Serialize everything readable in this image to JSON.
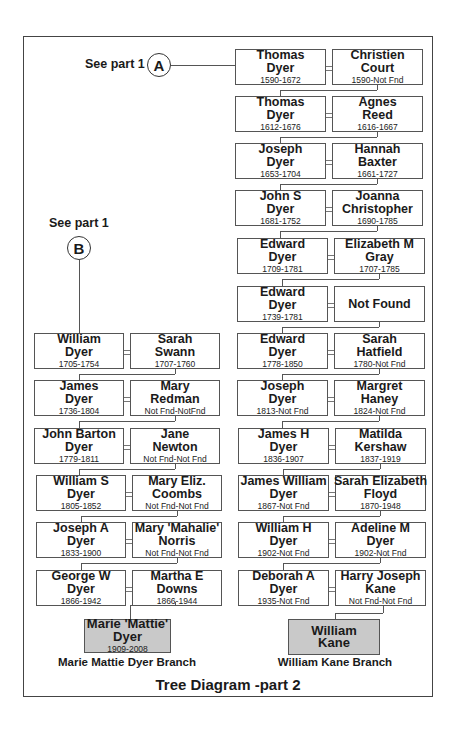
{
  "title": "Tree Diagram -part 2",
  "connectors": {
    "a": {
      "see_text": "See part 1",
      "letter": "A"
    },
    "b": {
      "see_text": "See part 1",
      "letter": "B"
    }
  },
  "right_column": [
    {
      "husband": {
        "name1": "Thomas",
        "name2": "Dyer",
        "dates": "1590-1672"
      },
      "wife": {
        "name1": "Christien",
        "name2": "Court",
        "dates": "1590-Not Fnd"
      }
    },
    {
      "husband": {
        "name1": "Thomas",
        "name2": "Dyer",
        "dates": "1612-1676"
      },
      "wife": {
        "name1": "Agnes",
        "name2": "Reed",
        "dates": "1616-1667"
      }
    },
    {
      "husband": {
        "name1": "Joseph",
        "name2": "Dyer",
        "dates": "1653-1704"
      },
      "wife": {
        "name1": "Hannah",
        "name2": "Baxter",
        "dates": "1661-1727"
      }
    },
    {
      "husband": {
        "name1": "John S",
        "name2": "Dyer",
        "dates": "1681-1752"
      },
      "wife": {
        "name1": "Joanna",
        "name2": "Christopher",
        "dates": "1690-1785"
      }
    },
    {
      "husband": {
        "name1": "Edward",
        "name2": "Dyer",
        "dates": "1709-1781"
      },
      "wife": {
        "name1": "Elizabeth M",
        "name2": "Gray",
        "dates": "1707-1785"
      }
    },
    {
      "husband": {
        "name1": "Edward",
        "name2": "Dyer",
        "dates": "1739-1781"
      },
      "wife": {
        "name1": "Not Found",
        "name2": "",
        "dates": ""
      }
    },
    {
      "husband": {
        "name1": "Edward",
        "name2": "Dyer",
        "dates": "1778-1850"
      },
      "wife": {
        "name1": "Sarah",
        "name2": "Hatfield",
        "dates": "1780-Not Fnd"
      }
    },
    {
      "husband": {
        "name1": "Joseph",
        "name2": "Dyer",
        "dates": "1813-Not Fnd"
      },
      "wife": {
        "name1": "Margret",
        "name2": "Haney",
        "dates": "1824-Not Fnd"
      }
    },
    {
      "husband": {
        "name1": "James H",
        "name2": "Dyer",
        "dates": "1836-1907"
      },
      "wife": {
        "name1": "Matilda",
        "name2": "Kershaw",
        "dates": "1837-1919"
      }
    },
    {
      "husband": {
        "name1": "James William",
        "name2": "Dyer",
        "dates": "1867-Not Fnd"
      },
      "wife": {
        "name1": "Sarah Elizabeth",
        "name2": "Floyd",
        "dates": "1870-1948"
      }
    },
    {
      "husband": {
        "name1": "William H",
        "name2": "Dyer",
        "dates": "1902-Not Fnd"
      },
      "wife": {
        "name1": "Adeline M",
        "name2": "Dyer",
        "dates": "1902-Not Fnd"
      }
    },
    {
      "husband": {
        "name1": "Deborah A",
        "name2": "Dyer",
        "dates": "1935-Not Fnd"
      },
      "wife": {
        "name1": "Harry Joseph",
        "name2": "Kane",
        "dates": "Not Fnd-Not Fnd"
      }
    }
  ],
  "right_descendant": {
    "name1": "William",
    "name2": "Kane",
    "dates": "",
    "branch_label": "William Kane Branch"
  },
  "left_column": [
    {
      "husband": {
        "name1": "William",
        "name2": "Dyer",
        "dates": "1705-1754"
      },
      "wife": {
        "name1": "Sarah",
        "name2": "Swann",
        "dates": "1707-1760"
      }
    },
    {
      "husband": {
        "name1": "James",
        "name2": "Dyer",
        "dates": "1736-1804"
      },
      "wife": {
        "name1": "Mary",
        "name2": "Redman",
        "dates": "Not Fnd-NotFnd"
      }
    },
    {
      "husband": {
        "name1": "John Barton",
        "name2": "Dyer",
        "dates": "1779-1811"
      },
      "wife": {
        "name1": "Jane",
        "name2": "Newton",
        "dates": "Not Fnd-Not Fnd"
      }
    },
    {
      "husband": {
        "name1": "William S",
        "name2": "Dyer",
        "dates": "1805-1852"
      },
      "wife": {
        "name1": "Mary Eliz.",
        "name2": "Coombs",
        "dates": "Not Fnd-Not Fnd"
      }
    },
    {
      "husband": {
        "name1": "Joseph A",
        "name2": "Dyer",
        "dates": "1833-1900"
      },
      "wife": {
        "name1": "Mary 'Mahalie'",
        "name2": "Norris",
        "dates": "Not Fnd-Not Fnd"
      }
    },
    {
      "husband": {
        "name1": "George W",
        "name2": "Dyer",
        "dates": "1866-1942"
      },
      "wife": {
        "name1": "Martha E",
        "name2": "Downs",
        "dates": "1866-1944"
      }
    }
  ],
  "left_descendant": {
    "name1": "Marie 'Mattie'",
    "name2": "Dyer",
    "dates": "1909-2008",
    "branch_label": "Marie Mattie Dyer Branch"
  }
}
